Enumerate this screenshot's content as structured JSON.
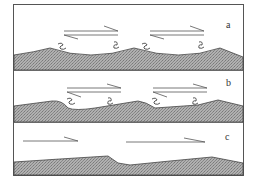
{
  "figure": {
    "panels": [
      {
        "id": "a",
        "label": "a",
        "description": "Symmetric bedforms with two opposing shear arrows and vortex swirls on both flanks"
      },
      {
        "id": "b",
        "label": "b",
        "description": "Asymmetric bedforms with opposing shear arrows and flank vortices"
      },
      {
        "id": "c",
        "label": "c",
        "description": "Low-relief bed with unidirectional flow arrows"
      }
    ],
    "colors": {
      "sediment_fill": "#9a9a9a",
      "outline": "#444444",
      "background": "#ffffff"
    }
  }
}
